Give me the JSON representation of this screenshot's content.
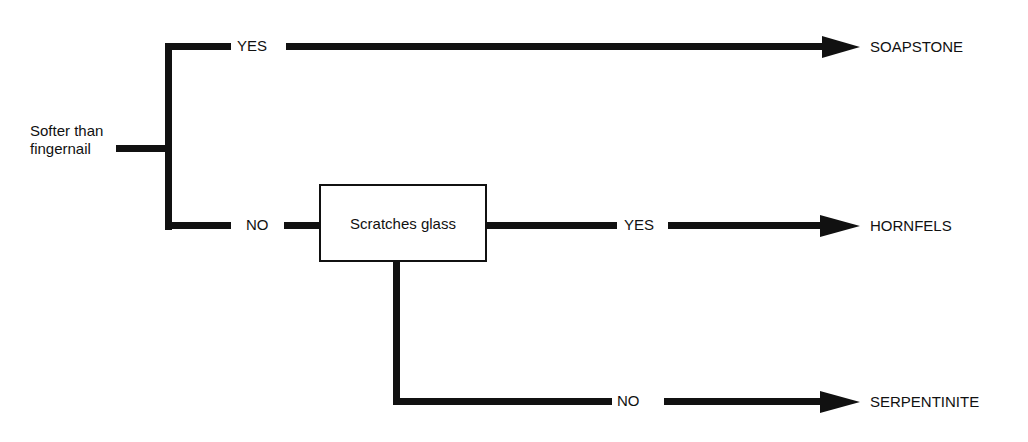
{
  "diagram": {
    "type": "decision-tree",
    "root": {
      "label_line1": "Softer than",
      "label_line2": "fingernail"
    },
    "branches": {
      "root_yes": "YES",
      "root_no": "NO",
      "test_box": "Scratches glass",
      "glass_yes": "YES",
      "glass_no": "NO"
    },
    "results": {
      "soapstone": "SOAPSTONE",
      "hornfels": "HORNFELS",
      "serpentinite": "SERPENTINITE"
    },
    "colors": {
      "line": "#111111",
      "background": "#ffffff"
    }
  }
}
